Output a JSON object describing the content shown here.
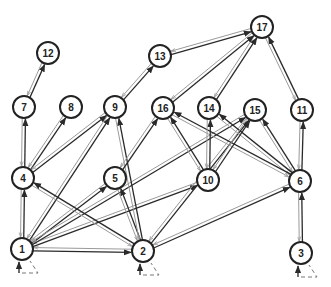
{
  "diagram": {
    "type": "directed-graph",
    "node_radius": 11,
    "colors": {
      "node_stroke": "#222222",
      "forward_edge": "#2a2a2a",
      "backward_edge": "#9a9a9a",
      "background": "#ffffff"
    },
    "nodes": [
      {
        "id": "1",
        "label": "1",
        "x": 22,
        "y": 249
      },
      {
        "id": "2",
        "label": "2",
        "x": 143,
        "y": 251
      },
      {
        "id": "3",
        "label": "3",
        "x": 301,
        "y": 253
      },
      {
        "id": "4",
        "label": "4",
        "x": 23,
        "y": 178
      },
      {
        "id": "5",
        "label": "5",
        "x": 115,
        "y": 178
      },
      {
        "id": "6",
        "label": "6",
        "x": 300,
        "y": 181
      },
      {
        "id": "7",
        "label": "7",
        "x": 24,
        "y": 107
      },
      {
        "id": "8",
        "label": "8",
        "x": 71,
        "y": 107
      },
      {
        "id": "9",
        "label": "9",
        "x": 115,
        "y": 107
      },
      {
        "id": "10",
        "label": "10",
        "x": 208,
        "y": 180
      },
      {
        "id": "11",
        "label": "11",
        "x": 302,
        "y": 110
      },
      {
        "id": "12",
        "label": "12",
        "x": 48,
        "y": 53
      },
      {
        "id": "13",
        "label": "13",
        "x": 160,
        "y": 56
      },
      {
        "id": "14",
        "label": "14",
        "x": 209,
        "y": 108
      },
      {
        "id": "15",
        "label": "15",
        "x": 255,
        "y": 110
      },
      {
        "id": "16",
        "label": "16",
        "x": 163,
        "y": 108
      },
      {
        "id": "17",
        "label": "17",
        "x": 262,
        "y": 27
      }
    ],
    "edges": [
      {
        "from": "1",
        "to": "4"
      },
      {
        "from": "1",
        "to": "9"
      },
      {
        "from": "1",
        "to": "5"
      },
      {
        "from": "1",
        "to": "10"
      },
      {
        "from": "1",
        "to": "15"
      },
      {
        "from": "1",
        "to": "2"
      },
      {
        "from": "2",
        "to": "4"
      },
      {
        "from": "2",
        "to": "5"
      },
      {
        "from": "2",
        "to": "9"
      },
      {
        "from": "2",
        "to": "15"
      },
      {
        "from": "2",
        "to": "6"
      },
      {
        "from": "3",
        "to": "6"
      },
      {
        "from": "4",
        "to": "7"
      },
      {
        "from": "4",
        "to": "8"
      },
      {
        "from": "4",
        "to": "9"
      },
      {
        "from": "5",
        "to": "16"
      },
      {
        "from": "6",
        "to": "11"
      },
      {
        "from": "6",
        "to": "15"
      },
      {
        "from": "6",
        "to": "14"
      },
      {
        "from": "6",
        "to": "16"
      },
      {
        "from": "7",
        "to": "12"
      },
      {
        "from": "9",
        "to": "13"
      },
      {
        "from": "10",
        "to": "16"
      },
      {
        "from": "10",
        "to": "14"
      },
      {
        "from": "10",
        "to": "15"
      },
      {
        "from": "11",
        "to": "17"
      },
      {
        "from": "13",
        "to": "17"
      },
      {
        "from": "14",
        "to": "17"
      },
      {
        "from": "16",
        "to": "17"
      }
    ],
    "entry_nodes": [
      "1",
      "2",
      "3"
    ]
  }
}
